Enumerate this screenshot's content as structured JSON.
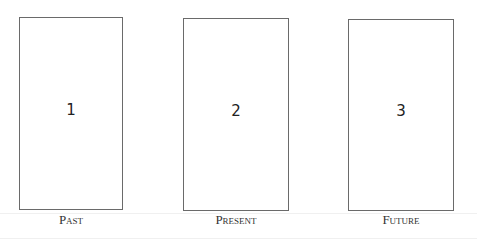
{
  "diagram": {
    "type": "card-spread",
    "cards": [
      {
        "number": "1",
        "label": "Past"
      },
      {
        "number": "2",
        "label": "Present"
      },
      {
        "number": "3",
        "label": "Future"
      }
    ]
  }
}
